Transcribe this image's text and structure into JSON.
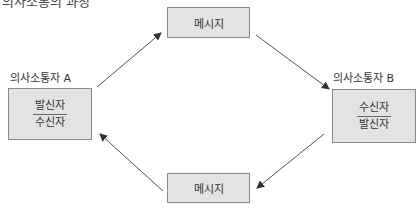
{
  "heading": "의사소통의 과정",
  "communicator_a": {
    "label": "의사소통자 A",
    "roles": [
      "발신자",
      "수신자"
    ]
  },
  "communicator_b": {
    "label": "의사소통자 B",
    "roles": [
      "수신자",
      "발신자"
    ]
  },
  "message_top": {
    "label": "메시지"
  },
  "message_bottom": {
    "label": "메시지"
  },
  "colors": {
    "box_fill": "#e3e3e3",
    "box_border": "#8a8a8a",
    "arrow": "#555555"
  }
}
